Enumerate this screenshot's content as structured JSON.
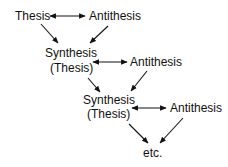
{
  "diagram": {
    "type": "dialectic-flow",
    "colors": {
      "text": "#111111",
      "arrows": "#111111",
      "background": "#ffffff"
    },
    "nodes": {
      "thesis": {
        "label": "Thesis"
      },
      "antithesis1": {
        "label": "Antithesis"
      },
      "synthesis1": {
        "line1": "Synthesis",
        "line2": "(Thesis)"
      },
      "antithesis2": {
        "label": "Antithesis"
      },
      "synthesis2": {
        "line1": "Synthesis",
        "line2": "(Thesis)"
      },
      "antithesis3": {
        "label": "Antithesis"
      },
      "etc": {
        "label": "etc."
      }
    },
    "edges": [
      {
        "from": "thesis",
        "to": "antithesis1",
        "type": "bidirectional"
      },
      {
        "from": "thesis",
        "to": "synthesis1",
        "type": "directed"
      },
      {
        "from": "antithesis1",
        "to": "synthesis1",
        "type": "directed"
      },
      {
        "from": "synthesis1",
        "to": "antithesis2",
        "type": "bidirectional"
      },
      {
        "from": "synthesis1",
        "to": "synthesis2",
        "type": "directed"
      },
      {
        "from": "antithesis2",
        "to": "synthesis2",
        "type": "directed"
      },
      {
        "from": "synthesis2",
        "to": "antithesis3",
        "type": "bidirectional"
      },
      {
        "from": "synthesis2",
        "to": "etc",
        "type": "directed"
      },
      {
        "from": "antithesis3",
        "to": "etc",
        "type": "directed"
      }
    ]
  }
}
